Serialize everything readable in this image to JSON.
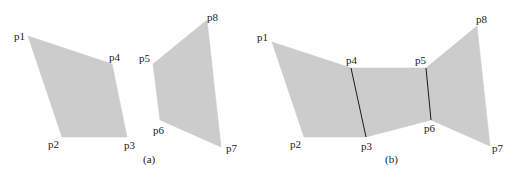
{
  "colors": {
    "fill": "#cccccc",
    "edge": "#1a1a1a",
    "text": "#222222"
  },
  "panel_a": {
    "caption": "(a)",
    "caption_pos": [
      143,
      163
    ],
    "shapes": [
      {
        "name": "quad-left",
        "points": [
          [
            28,
            36
          ],
          [
            62,
            137
          ],
          [
            127,
            137
          ],
          [
            112,
            64
          ]
        ]
      },
      {
        "name": "quad-right",
        "points": [
          [
            153,
            64
          ],
          [
            160,
            120
          ],
          [
            221,
            147
          ],
          [
            207,
            20
          ]
        ]
      }
    ],
    "labels": [
      {
        "text": "p1",
        "x": 14,
        "y": 40
      },
      {
        "text": "p2",
        "x": 48,
        "y": 148
      },
      {
        "text": "p3",
        "x": 124,
        "y": 149
      },
      {
        "text": "p4",
        "x": 109,
        "y": 61
      },
      {
        "text": "p5",
        "x": 139,
        "y": 62
      },
      {
        "text": "p6",
        "x": 153,
        "y": 134
      },
      {
        "text": "p7",
        "x": 226,
        "y": 152
      },
      {
        "text": "p8",
        "x": 207,
        "y": 21
      }
    ]
  },
  "panel_b": {
    "caption": "(b)",
    "caption_pos": [
      385,
      163
    ],
    "shapes": [
      {
        "name": "quad-1",
        "points": [
          [
            272,
            42
          ],
          [
            304,
            137
          ],
          [
            366,
            137
          ],
          [
            351,
            68
          ]
        ]
      },
      {
        "name": "quad-2",
        "points": [
          [
            351,
            68
          ],
          [
            366,
            137
          ],
          [
            431,
            120
          ],
          [
            426,
            68
          ]
        ]
      },
      {
        "name": "quad-3",
        "points": [
          [
            426,
            68
          ],
          [
            431,
            120
          ],
          [
            490,
            146
          ],
          [
            477,
            26
          ]
        ]
      }
    ],
    "edges": [
      {
        "name": "seam-p4-p3",
        "from": [
          351,
          68
        ],
        "to": [
          366,
          137
        ]
      },
      {
        "name": "seam-p5-p6",
        "from": [
          426,
          68
        ],
        "to": [
          431,
          120
        ]
      }
    ],
    "labels": [
      {
        "text": "p1",
        "x": 257,
        "y": 41
      },
      {
        "text": "p2",
        "x": 290,
        "y": 148
      },
      {
        "text": "p3",
        "x": 361,
        "y": 150
      },
      {
        "text": "p4",
        "x": 346,
        "y": 64
      },
      {
        "text": "p5",
        "x": 415,
        "y": 64
      },
      {
        "text": "p6",
        "x": 424,
        "y": 132
      },
      {
        "text": "p7",
        "x": 492,
        "y": 152
      },
      {
        "text": "p8",
        "x": 476,
        "y": 23
      }
    ]
  }
}
